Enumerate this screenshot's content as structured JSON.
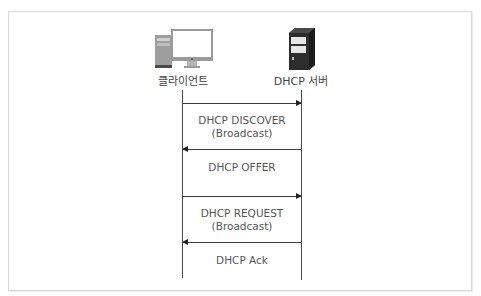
{
  "diagram": {
    "type": "sequence",
    "title": "",
    "actors": [
      {
        "id": "client",
        "label": "클라이언트",
        "icon": "desktop-computer-icon"
      },
      {
        "id": "server",
        "label": "DHCP 서버",
        "icon": "server-tower-icon"
      }
    ],
    "messages": [
      {
        "from": "client",
        "to": "server",
        "line1": "DHCP DISCOVER",
        "line2": "(Broadcast)"
      },
      {
        "from": "server",
        "to": "client",
        "line1": "DHCP OFFER",
        "line2": ""
      },
      {
        "from": "client",
        "to": "server",
        "line1": "DHCP REQUEST",
        "line2": "(Broadcast)"
      },
      {
        "from": "server",
        "to": "client",
        "line1": "DHCP Ack",
        "line2": ""
      }
    ]
  },
  "colors": {
    "line": "#3c3c3c",
    "text": "#555555",
    "border": "#d9d9d9"
  }
}
